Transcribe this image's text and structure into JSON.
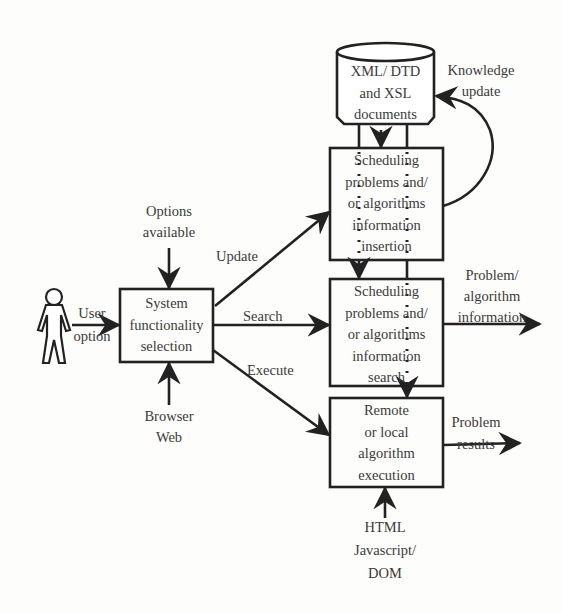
{
  "diagram": {
    "database": {
      "lines": [
        "XML/ DTD",
        "and XSL",
        "documents"
      ]
    },
    "knowledge_update": {
      "lines": [
        "Knowledge",
        "update"
      ]
    },
    "insertion_box": {
      "lines": [
        "Scheduling",
        "problems and/",
        "or algorithms",
        "information",
        "insertion"
      ]
    },
    "search_box": {
      "lines": [
        "Scheduling",
        "problems and/",
        "or algorithms",
        "information",
        "search"
      ]
    },
    "execution_box": {
      "lines": [
        "Remote",
        "or local",
        "algorithm",
        "execution"
      ]
    },
    "selection_box": {
      "lines": [
        "System",
        "functionality",
        "selection"
      ]
    },
    "options_available": {
      "lines": [
        "Options",
        "available"
      ]
    },
    "browser_web": {
      "lines": [
        "Browser",
        "Web"
      ]
    },
    "user_option": {
      "lines": [
        "User",
        "option"
      ]
    },
    "edges": {
      "update": "Update",
      "search": "Search",
      "execute": "Execute"
    },
    "problem_algorithm_info": {
      "lines": [
        "Problem/",
        "algorithm",
        "information"
      ]
    },
    "problem_results": {
      "lines": [
        "Problem",
        "results"
      ]
    },
    "html_js_dom": {
      "lines": [
        "HTML",
        "Javascript/",
        "DOM"
      ]
    }
  }
}
